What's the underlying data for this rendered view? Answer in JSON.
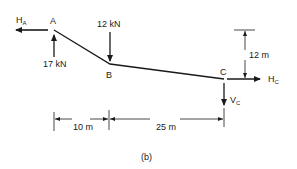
{
  "figure": {
    "caption": "(b)",
    "points": {
      "A": {
        "label": "A"
      },
      "B": {
        "label": "B"
      },
      "C": {
        "label": "C"
      }
    },
    "forces": {
      "HA": {
        "main": "H",
        "sub": "A"
      },
      "A_vertical": {
        "label": "17 kN"
      },
      "B_load": {
        "label": "12 kN"
      },
      "HC": {
        "main": "H",
        "sub": "C"
      },
      "VC": {
        "main": "V",
        "sub": "C"
      }
    },
    "dimensions": {
      "height_C": "12 m",
      "span_AB": "10 m",
      "span_BC": "25 m"
    }
  }
}
